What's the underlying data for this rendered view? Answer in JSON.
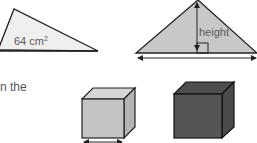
{
  "left_triangle": {
    "area_value": "64 cm",
    "area_exponent": "2",
    "fill": "#efefef"
  },
  "right_triangle": {
    "height_label": "height",
    "fill": "#c8c8c8"
  },
  "text_fragment": "n the",
  "cubes": [
    {
      "name": "small-light-cube",
      "fill": "#c4c4c4"
    },
    {
      "name": "large-dark-cube",
      "fill": "#555555"
    }
  ]
}
